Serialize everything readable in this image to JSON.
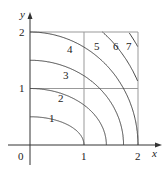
{
  "diagram": {
    "type": "contour-map",
    "axes": {
      "x_label": "x",
      "y_label": "y",
      "origin_label": "0",
      "x_ticks": [
        "1",
        "2"
      ],
      "y_ticks": [
        "1",
        "2"
      ]
    },
    "contours": [
      {
        "level": "1",
        "a": 1.0,
        "b": 0.5
      },
      {
        "level": "2",
        "a": 1.414,
        "b": 1.0
      },
      {
        "level": "3",
        "a": 1.732,
        "b": 1.5
      },
      {
        "level": "4",
        "a": 2.0,
        "b": 2.0
      },
      {
        "level": "5",
        "a": 2.236,
        "b": 2.5
      },
      {
        "level": "6",
        "a": 2.449,
        "b": 3.0
      },
      {
        "level": "7",
        "a": 2.646,
        "b": 3.5
      }
    ],
    "colors": {
      "curve": "#444444",
      "grid": "#999999",
      "axis": "#333333"
    }
  }
}
